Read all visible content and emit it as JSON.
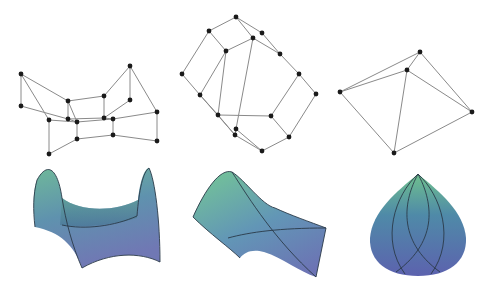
{
  "diagram": {
    "layout": "2 rows x 3 columns: graph embeddings (top) above corresponding shaded surfaces (bottom)",
    "colors": {
      "background": "#ffffff",
      "edge": "#8a8a8a",
      "node": "#1a1a1a",
      "surface_top": "#6fb89a",
      "surface_mid": "#5e8fb0",
      "surface_bottom": "#6a72b0",
      "surface_outline": "#2a3a48"
    },
    "graphs": [
      {
        "name": "graph-left",
        "nodes": [
          [
            21,
            74
          ],
          [
            21,
            106
          ],
          [
            49,
            120
          ],
          [
            49,
            154
          ],
          [
            68,
            101
          ],
          [
            68,
            119
          ],
          [
            77,
            122
          ],
          [
            77,
            139
          ],
          [
            104,
            96
          ],
          [
            104,
            118
          ],
          [
            113,
            119
          ],
          [
            113,
            135
          ],
          [
            130,
            66
          ],
          [
            130,
            100
          ],
          [
            157,
            112
          ],
          [
            157,
            141
          ]
        ],
        "edges": [
          [
            0,
            1
          ],
          [
            0,
            4
          ],
          [
            0,
            2
          ],
          [
            1,
            5
          ],
          [
            2,
            3
          ],
          [
            2,
            6
          ],
          [
            3,
            7
          ],
          [
            4,
            5
          ],
          [
            4,
            8
          ],
          [
            4,
            6
          ],
          [
            5,
            6
          ],
          [
            6,
            10
          ],
          [
            7,
            11
          ],
          [
            6,
            7
          ],
          [
            8,
            9
          ],
          [
            8,
            12
          ],
          [
            9,
            10
          ],
          [
            9,
            13
          ],
          [
            10,
            11
          ],
          [
            10,
            14
          ],
          [
            11,
            15
          ],
          [
            12,
            13
          ],
          [
            12,
            14
          ],
          [
            14,
            15
          ],
          [
            5,
            9
          ]
        ]
      },
      {
        "name": "graph-middle",
        "nodes": [
          [
            236,
            17
          ],
          [
            209,
            31
          ],
          [
            262,
            33
          ],
          [
            226,
            51
          ],
          [
            253,
            38
          ],
          [
            280,
            54
          ],
          [
            182,
            74
          ],
          [
            299,
            74
          ],
          [
            200,
            95
          ],
          [
            316,
            94
          ],
          [
            218,
            115
          ],
          [
            271,
            116
          ],
          [
            236,
            129
          ],
          [
            235,
            135
          ],
          [
            289,
            137
          ],
          [
            262,
            151
          ]
        ],
        "edges": [
          [
            0,
            1
          ],
          [
            0,
            2
          ],
          [
            0,
            4
          ],
          [
            1,
            3
          ],
          [
            1,
            6
          ],
          [
            2,
            5
          ],
          [
            3,
            4
          ],
          [
            3,
            10
          ],
          [
            4,
            5
          ],
          [
            4,
            12
          ],
          [
            5,
            7
          ],
          [
            6,
            8
          ],
          [
            7,
            9
          ],
          [
            7,
            11
          ],
          [
            8,
            10
          ],
          [
            8,
            13
          ],
          [
            9,
            14
          ],
          [
            10,
            11
          ],
          [
            10,
            13
          ],
          [
            11,
            14
          ],
          [
            12,
            13
          ],
          [
            13,
            15
          ],
          [
            14,
            15
          ],
          [
            12,
            15
          ],
          [
            3,
            8
          ]
        ]
      },
      {
        "name": "graph-right",
        "nodes": [
          [
            340,
            92
          ],
          [
            407,
            70
          ],
          [
            420,
            52
          ],
          [
            394,
            153
          ],
          [
            472,
            112
          ]
        ],
        "edges": [
          [
            0,
            1
          ],
          [
            0,
            2
          ],
          [
            0,
            3
          ],
          [
            1,
            2
          ],
          [
            1,
            3
          ],
          [
            1,
            4
          ],
          [
            2,
            4
          ],
          [
            3,
            4
          ]
        ]
      }
    ],
    "surfaces": [
      {
        "name": "saddle-surface",
        "shape": "hyperbolic saddle"
      },
      {
        "name": "twisted-surface",
        "shape": "twisted band with crossing curves"
      },
      {
        "name": "drop-surface",
        "shape": "teardrop with lens-shaped curves"
      }
    ]
  }
}
